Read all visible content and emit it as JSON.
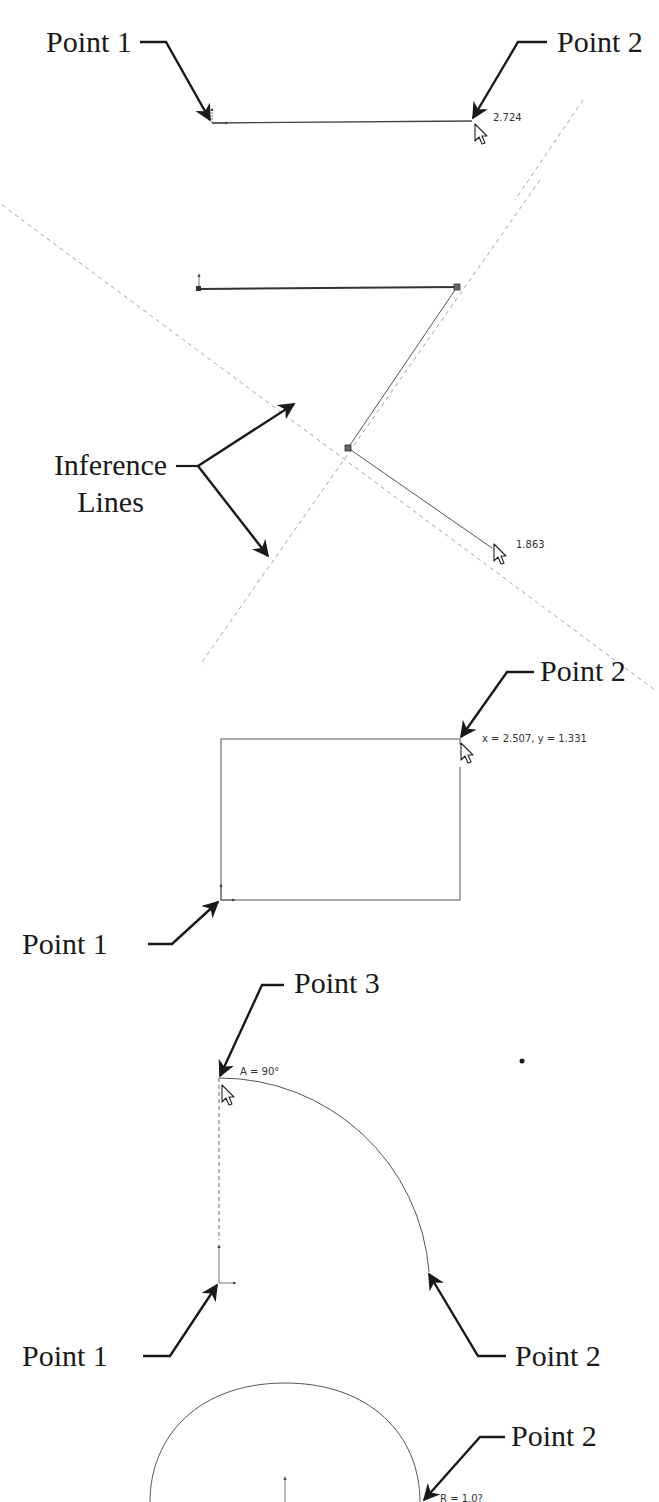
{
  "colors": {
    "background": "#ffffff",
    "geometry": "#444444",
    "callout": "#1a1a1a",
    "inference": "#888888"
  },
  "panels": [
    {
      "id": "line",
      "callouts": [
        {
          "label": "Point 1"
        },
        {
          "label": "Point 2"
        }
      ],
      "dimension": "2.724"
    },
    {
      "id": "inference",
      "callouts": [
        {
          "label_line1": "Inference",
          "label_line2": "Lines"
        }
      ],
      "dimension": "1.863"
    },
    {
      "id": "rectangle",
      "callouts": [
        {
          "label": "Point 2"
        },
        {
          "label": "Point 1"
        }
      ],
      "dimension": "x = 2.507, y = 1.331"
    },
    {
      "id": "arc",
      "callouts": [
        {
          "label": "Point 3"
        },
        {
          "label": "Point 1"
        },
        {
          "label": "Point 2"
        }
      ],
      "dimension": "A = 90°"
    },
    {
      "id": "circle",
      "callouts": [
        {
          "label": "Point 2"
        }
      ],
      "dimension": "R = 1.0?"
    }
  ],
  "icons": {
    "cursor": "arrow-cursor-icon",
    "origin": "origin-axes-icon",
    "endpoint": "endpoint-square-icon"
  }
}
